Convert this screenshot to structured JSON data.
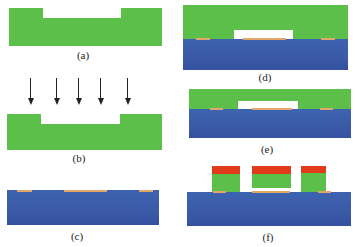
{
  "figure": {
    "panels": [
      {
        "id": "a",
        "label": "(a)",
        "description": "Patterned green layer with central recess"
      },
      {
        "id": "b",
        "label": "(b)",
        "description": "Green layer exposed by vertical irradiation arrows"
      },
      {
        "id": "c",
        "label": "(c)",
        "description": "Blue substrate with orange surface pads"
      },
      {
        "id": "d",
        "label": "(d)",
        "description": "Green layer bonded onto substrate with central white cavity"
      },
      {
        "id": "e",
        "label": "(e)",
        "description": "Thinned green layer over substrate with white cavity"
      },
      {
        "id": "f",
        "label": "(f)",
        "description": "Patterned green blocks with red caps over substrate"
      }
    ],
    "arrow_count": 5,
    "colors": {
      "green_layer": "#5cbf4a",
      "blue_substrate": "#3b5aa6",
      "orange_pad": "#e2a56a",
      "red_cap": "#e23b1c",
      "cavity": "#ffffff"
    }
  }
}
